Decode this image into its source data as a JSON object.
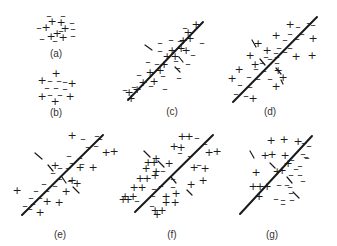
{
  "figure": {
    "panels": [
      {
        "id": "a",
        "label": "(a)",
        "has_line": false,
        "symbols": [
          [
            "-",
            49,
            15
          ],
          [
            "-",
            63,
            15
          ],
          [
            "+",
            52,
            21
          ],
          [
            "+",
            61,
            22
          ],
          [
            "-",
            72,
            22
          ],
          [
            "-",
            39,
            27
          ],
          [
            "+",
            46,
            27
          ],
          [
            "+",
            65,
            28
          ],
          [
            "-",
            73,
            28
          ],
          [
            "+",
            57,
            33
          ],
          [
            "-",
            42,
            38
          ],
          [
            "+",
            51,
            36
          ],
          [
            "+",
            63,
            37
          ],
          [
            "-",
            73,
            35
          ],
          [
            "-",
            55,
            40
          ],
          [
            "-",
            61,
            30
          ]
        ]
      },
      {
        "id": "b",
        "label": "(b)",
        "has_line": false,
        "symbols": [
          [
            "+",
            56,
            73
          ],
          [
            "+",
            42,
            80
          ],
          [
            "-",
            50,
            80
          ],
          [
            "-",
            59,
            80
          ],
          [
            "-",
            65,
            81
          ],
          [
            "+",
            72,
            83
          ],
          [
            "-",
            47,
            87
          ],
          [
            "-",
            56,
            87
          ],
          [
            "-",
            65,
            88
          ],
          [
            "+",
            42,
            96
          ],
          [
            "-",
            50,
            94
          ],
          [
            "-",
            60,
            94
          ],
          [
            "+",
            70,
            96
          ],
          [
            "+",
            55,
            101
          ]
        ]
      },
      {
        "id": "c",
        "label": "(c)",
        "has_line": true,
        "symbols": [
          [
            "-",
            185,
            27
          ],
          [
            "+",
            196,
            24
          ],
          [
            "+",
            188,
            32
          ],
          [
            "-",
            160,
            42
          ],
          [
            "-",
            171,
            39
          ],
          [
            "-",
            180,
            40
          ],
          [
            "+",
            183,
            40
          ],
          [
            "+",
            190,
            38
          ],
          [
            "-",
            202,
            42
          ],
          [
            "-",
            160,
            50
          ],
          [
            "+",
            172,
            50
          ],
          [
            "+",
            181,
            48
          ],
          [
            "+",
            186,
            50
          ],
          [
            "-",
            193,
            54
          ],
          [
            "-",
            148,
            61
          ],
          [
            "+",
            167,
            56
          ],
          [
            "+",
            175,
            56
          ],
          [
            "-",
            176,
            60
          ],
          [
            "-",
            157,
            63
          ],
          [
            "+",
            164,
            64
          ],
          [
            "-",
            178,
            67
          ],
          [
            "-",
            188,
            63
          ],
          [
            "-",
            139,
            74
          ],
          [
            "+",
            150,
            72
          ],
          [
            "+",
            160,
            70
          ],
          [
            "-",
            163,
            75
          ],
          [
            "-",
            179,
            77
          ],
          [
            "-",
            134,
            86
          ],
          [
            "+",
            143,
            82
          ],
          [
            "+",
            154,
            81
          ],
          [
            "-",
            151,
            85
          ],
          [
            "-",
            165,
            88
          ],
          [
            "-",
            125,
            89
          ],
          [
            "+",
            129,
            92
          ],
          [
            "+",
            137,
            89
          ],
          [
            "+",
            131,
            98
          ]
        ],
        "ticks": [
          [
            145,
            45,
            152,
            50
          ],
          [
            179,
            57,
            183,
            62
          ],
          [
            175,
            67,
            180,
            72
          ]
        ]
      },
      {
        "id": "d",
        "label": "(d)",
        "has_line": true,
        "symbols": [
          [
            "+",
            290,
            24
          ],
          [
            "-",
            298,
            26
          ],
          [
            "-",
            309,
            22
          ],
          [
            "-",
            313,
            24
          ],
          [
            "+",
            276,
            35
          ],
          [
            "-",
            290,
            33
          ],
          [
            "-",
            302,
            33
          ],
          [
            "+",
            313,
            38
          ],
          [
            "-",
            285,
            39
          ],
          [
            "-",
            297,
            38
          ],
          [
            "+",
            258,
            43
          ],
          [
            "-",
            279,
            47
          ],
          [
            "-",
            290,
            47
          ],
          [
            "+",
            267,
            50
          ],
          [
            "-",
            276,
            52
          ],
          [
            "-",
            285,
            51
          ],
          [
            "+",
            250,
            55
          ],
          [
            "-",
            266,
            56
          ],
          [
            "-",
            277,
            56
          ],
          [
            "+",
            296,
            56
          ],
          [
            "+",
            312,
            55
          ],
          [
            "+",
            255,
            64
          ],
          [
            "-",
            262,
            62
          ],
          [
            "-",
            270,
            58
          ],
          [
            "-",
            277,
            62
          ],
          [
            "+",
            239,
            69
          ],
          [
            "-",
            256,
            68
          ],
          [
            "-",
            264,
            70
          ],
          [
            "+",
            278,
            70
          ],
          [
            "+",
            283,
            77
          ],
          [
            "+",
            232,
            78
          ],
          [
            "-",
            249,
            76
          ],
          [
            "-",
            258,
            78
          ],
          [
            "-",
            270,
            78
          ],
          [
            "-",
            240,
            84
          ],
          [
            "-",
            250,
            86
          ],
          [
            "+",
            276,
            86
          ],
          [
            "-",
            236,
            93
          ],
          [
            "-",
            246,
            95
          ],
          [
            "+",
            253,
            98
          ]
        ],
        "ticks": [
          [
            252,
            40,
            256,
            47
          ],
          [
            260,
            59,
            265,
            65
          ],
          [
            276,
            68,
            281,
            74
          ],
          [
            281,
            80,
            283,
            84
          ]
        ]
      },
      {
        "id": "e",
        "label": "(e)",
        "has_line": true,
        "symbols": [
          [
            "+",
            72,
            135
          ],
          [
            "-",
            83,
            138
          ],
          [
            "-",
            97,
            135
          ],
          [
            "-",
            100,
            138
          ],
          [
            "-",
            88,
            146
          ],
          [
            "-",
            96,
            145
          ],
          [
            "+",
            106,
            152
          ],
          [
            "+",
            114,
            151
          ],
          [
            "-",
            69,
            155
          ],
          [
            "-",
            80,
            157
          ],
          [
            "-",
            72,
            162
          ],
          [
            "-",
            82,
            163
          ],
          [
            "+",
            55,
            165
          ],
          [
            "-",
            60,
            167
          ],
          [
            "-",
            68,
            167
          ],
          [
            "+",
            80,
            167
          ],
          [
            "+",
            93,
            167
          ],
          [
            "-",
            53,
            172
          ],
          [
            "-",
            60,
            178
          ],
          [
            "-",
            70,
            180
          ],
          [
            "+",
            72,
            180
          ],
          [
            "-",
            44,
            183
          ],
          [
            "-",
            55,
            185
          ],
          [
            "+",
            77,
            183
          ],
          [
            "+",
            17,
            190
          ],
          [
            "-",
            36,
            190
          ],
          [
            "-",
            47,
            190
          ],
          [
            "+",
            66,
            191
          ],
          [
            "-",
            31,
            197
          ],
          [
            "-",
            40,
            197
          ],
          [
            "+",
            47,
            201
          ],
          [
            "+",
            59,
            202
          ],
          [
            "-",
            25,
            205
          ],
          [
            "-",
            33,
            203
          ],
          [
            "-",
            30,
            208
          ],
          [
            "+",
            40,
            212
          ]
        ],
        "ticks": [
          [
            35,
            153,
            42,
            159
          ],
          [
            48,
            165,
            53,
            171
          ],
          [
            62,
            177,
            66,
            183
          ],
          [
            73,
            187,
            79,
            193
          ]
        ]
      },
      {
        "id": "f",
        "label": "(f)",
        "has_line": true,
        "symbols": [
          [
            "+",
            182,
            136
          ],
          [
            "+",
            189,
            136
          ],
          [
            "-",
            197,
            137
          ],
          [
            "-",
            205,
            143
          ],
          [
            "+",
            174,
            146
          ],
          [
            "+",
            181,
            147
          ],
          [
            "-",
            180,
            152
          ],
          [
            "+",
            209,
            152
          ],
          [
            "+",
            217,
            151
          ],
          [
            "-",
            190,
            155
          ],
          [
            "+",
            156,
            158
          ],
          [
            "+",
            148,
            162
          ],
          [
            "+",
            154,
            162
          ],
          [
            "+",
            169,
            163
          ],
          [
            "+",
            146,
            168
          ],
          [
            "+",
            156,
            171
          ],
          [
            "-",
            163,
            170
          ],
          [
            "-",
            199,
            164
          ],
          [
            "+",
            194,
            167
          ],
          [
            "+",
            205,
            168
          ],
          [
            "+",
            140,
            178
          ],
          [
            "+",
            147,
            178
          ],
          [
            "+",
            155,
            175
          ],
          [
            "-",
            173,
            178
          ],
          [
            "-",
            161,
            185
          ],
          [
            "-",
            173,
            186
          ],
          [
            "+",
            191,
            184
          ],
          [
            "+",
            203,
            180
          ],
          [
            "+",
            134,
            187
          ],
          [
            "+",
            142,
            187
          ],
          [
            "-",
            154,
            188
          ],
          [
            "+",
            125,
            196
          ],
          [
            "+",
            133,
            196
          ],
          [
            "+",
            123,
            199
          ],
          [
            "+",
            128,
            199
          ],
          [
            "-",
            137,
            200
          ],
          [
            "-",
            153,
            195
          ],
          [
            "+",
            166,
            196
          ],
          [
            "+",
            176,
            193
          ],
          [
            "-",
            152,
            205
          ],
          [
            "+",
            166,
            202
          ],
          [
            "+",
            175,
            202
          ],
          [
            "+",
            155,
            210
          ],
          [
            "+",
            162,
            210
          ],
          [
            "+",
            157,
            214
          ]
        ],
        "ticks": [
          [
            144,
            151,
            150,
            157
          ],
          [
            158,
            161,
            164,
            167
          ],
          [
            171,
            177,
            176,
            183
          ],
          [
            187,
            190,
            192,
            195
          ]
        ]
      },
      {
        "id": "g",
        "label": "(g)",
        "has_line": true,
        "symbols": [
          [
            "+",
            271,
            140
          ],
          [
            "+",
            284,
            139
          ],
          [
            "+",
            298,
            141
          ],
          [
            "-",
            304,
            142
          ],
          [
            "-",
            309,
            145
          ],
          [
            "+",
            265,
            155
          ],
          [
            "+",
            272,
            154
          ],
          [
            "-",
            303,
            153
          ],
          [
            "-",
            306,
            156
          ],
          [
            "+",
            285,
            155
          ],
          [
            "-",
            292,
            159
          ],
          [
            "-",
            307,
            157
          ],
          [
            "-",
            300,
            165
          ],
          [
            "-",
            296,
            168
          ],
          [
            "+",
            288,
            163
          ],
          [
            "+",
            277,
            171
          ],
          [
            "+",
            282,
            170
          ],
          [
            "-",
            291,
            174
          ],
          [
            "-",
            300,
            174
          ],
          [
            "+",
            256,
            172
          ],
          [
            "-",
            303,
            180
          ],
          [
            "-",
            279,
            184
          ],
          [
            "-",
            287,
            184
          ],
          [
            "-",
            290,
            186
          ],
          [
            "-",
            291,
            192
          ],
          [
            "+",
            253,
            186
          ],
          [
            "+",
            260,
            186
          ],
          [
            "+",
            267,
            186
          ],
          [
            "+",
            259,
            196
          ],
          [
            "-",
            276,
            198
          ],
          [
            "-",
            283,
            199
          ],
          [
            "-",
            292,
            199
          ],
          [
            "-",
            283,
            203
          ]
        ],
        "ticks": [
          [
            250,
            151,
            254,
            158
          ],
          [
            270,
            163,
            275,
            168
          ],
          [
            287,
            177,
            292,
            183
          ],
          [
            293,
            192,
            299,
            198
          ]
        ]
      }
    ],
    "lines": {
      "c": [
        128,
        100,
        203,
        22
      ],
      "d": [
        233,
        102,
        317,
        17
      ],
      "e": [
        22,
        215,
        103,
        135
      ],
      "f": [
        135,
        212,
        213,
        135
      ],
      "g": [
        240,
        214,
        312,
        136
      ]
    },
    "labels": {
      "a": [
        56,
        57
      ],
      "b": [
        56,
        116
      ],
      "c": [
        172,
        115
      ],
      "d": [
        270,
        115
      ],
      "e": [
        60,
        238
      ],
      "f": [
        172,
        238
      ],
      "g": [
        272,
        238
      ]
    }
  }
}
